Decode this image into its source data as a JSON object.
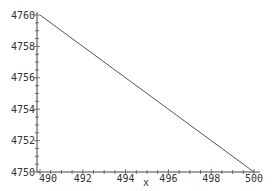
{
  "chart_data": {
    "type": "line",
    "title": "",
    "xlabel": "x",
    "ylabel": "",
    "xlim": [
      490,
      500
    ],
    "ylim": [
      4750,
      4760
    ],
    "x_ticks": [
      490,
      492,
      494,
      496,
      498,
      500
    ],
    "y_ticks": [
      4750,
      4752,
      4754,
      4756,
      4758,
      4760
    ],
    "grid": false,
    "legend": null,
    "series": [
      {
        "name": "line",
        "color": "#555555",
        "x": [
          490,
          500
        ],
        "y": [
          4760,
          4750
        ]
      }
    ]
  },
  "labels": {
    "xlabel": "x",
    "x_ticks": [
      "490",
      "492",
      "494",
      "496",
      "498",
      "500"
    ],
    "y_ticks": [
      "4750",
      "4752",
      "4754",
      "4756",
      "4758",
      "4760"
    ]
  }
}
